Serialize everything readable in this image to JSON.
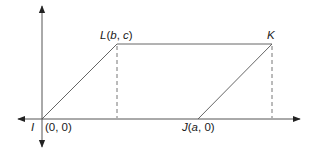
{
  "diagram": {
    "type": "coordinate-geometry-parallelogram",
    "colors": {
      "line": "#555555",
      "axis": "#444444",
      "text": "#1a1a1a",
      "background": "#ffffff"
    },
    "points": {
      "I": {
        "name": "I",
        "coords": "(0, 0)"
      },
      "J": {
        "name": "J",
        "coords": "(a, 0)",
        "label": "J(a, 0)"
      },
      "K": {
        "name": "K",
        "label": "K"
      },
      "L": {
        "name": "L",
        "coords": "(b, c)",
        "label": "L(b, c)"
      }
    },
    "labels": {
      "I": "I",
      "origin": "(0, 0)",
      "J_name": "J",
      "J_coords": "(a, 0)",
      "L_name": "L",
      "L_coords": "(b, c)",
      "K": "K"
    },
    "segments": [
      "IL",
      "LK",
      "KJ",
      "JI"
    ],
    "dashed": [
      "L-to-x-axis",
      "K-to-x-axis"
    ],
    "axes": {
      "x": "horizontal, double-arrow",
      "y": "vertical, double-arrow"
    }
  }
}
